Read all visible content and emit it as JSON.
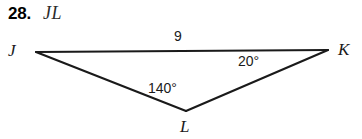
{
  "problem": {
    "number": "28.",
    "expression": "JL"
  },
  "figure": {
    "type": "triangle",
    "vertices": [
      {
        "name": "J",
        "label": "J",
        "x": 36,
        "y": 52
      },
      {
        "name": "K",
        "label": "K",
        "x": 328,
        "y": 50
      },
      {
        "name": "L",
        "label": "L",
        "x": 186,
        "y": 111
      }
    ],
    "sides": [
      {
        "from": "J",
        "to": "K",
        "label": "9"
      },
      {
        "from": "J",
        "to": "L",
        "label": ""
      },
      {
        "from": "L",
        "to": "K",
        "label": ""
      }
    ],
    "angles": [
      {
        "at": "K",
        "label": "20°",
        "value": 20
      },
      {
        "at": "L",
        "label": "140°",
        "value": 140
      }
    ],
    "stroke_color": "#1a1a1a",
    "background_color": "#ffffff"
  }
}
